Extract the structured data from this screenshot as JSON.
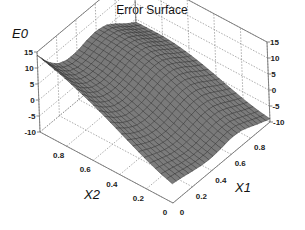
{
  "chart_data": {
    "type": "surface3d",
    "title": "Error Surface",
    "xlabel": "X1",
    "ylabel": "X2",
    "zlabel": "E0",
    "xlim": [
      0,
      1
    ],
    "ylim": [
      0,
      1
    ],
    "zlim": [
      -10,
      15
    ],
    "x_ticks": [
      "0",
      "0.2",
      "0.4",
      "0.6",
      "0.8"
    ],
    "y_ticks": [
      "0",
      "0.2",
      "0.4",
      "0.6",
      "0.8"
    ],
    "z_ticks": [
      "-10",
      "-5",
      "0",
      "5",
      "10",
      "15"
    ],
    "grid": true,
    "surface_color": "#7a7a7a",
    "grid_resolution": 11,
    "x": [
      0,
      0.1,
      0.2,
      0.3,
      0.4,
      0.5,
      0.6,
      0.7,
      0.8,
      0.9,
      1.0
    ],
    "y": [
      0,
      0.1,
      0.2,
      0.3,
      0.4,
      0.5,
      0.6,
      0.7,
      0.8,
      0.9,
      1.0
    ],
    "z_rows_by_x2": [
      [
        -4.0,
        -4.5,
        -5.2,
        -5.8,
        -6.0,
        -5.6,
        -5.0,
        -5.2,
        -6.4,
        -7.8,
        -9.0
      ],
      [
        -2.5,
        -3.4,
        -4.4,
        -5.0,
        -5.0,
        -4.4,
        -3.8,
        -4.0,
        -5.3,
        -6.9,
        -8.3
      ],
      [
        -0.6,
        -2.0,
        -3.3,
        -3.9,
        -3.7,
        -2.9,
        -2.2,
        -2.4,
        -3.8,
        -5.6,
        -7.2
      ],
      [
        1.6,
        -0.4,
        -1.9,
        -2.5,
        -2.2,
        -1.2,
        -0.4,
        -0.6,
        -2.1,
        -4.1,
        -5.9
      ],
      [
        3.8,
        1.3,
        -0.4,
        -1.0,
        -0.6,
        0.5,
        1.4,
        1.2,
        -0.4,
        -2.6,
        -4.5
      ],
      [
        6.0,
        3.0,
        1.1,
        0.5,
        0.9,
        2.1,
        3.0,
        2.8,
        1.1,
        -1.2,
        -3.2
      ],
      [
        8.0,
        4.6,
        2.5,
        1.8,
        2.3,
        3.5,
        4.4,
        4.1,
        2.3,
        -0.1,
        -2.1
      ],
      [
        9.8,
        6.1,
        3.8,
        3.0,
        3.4,
        4.6,
        5.4,
        5.0,
        3.2,
        0.7,
        -1.3
      ],
      [
        11.5,
        7.4,
        4.8,
        3.9,
        4.2,
        5.3,
        6.0,
        5.5,
        3.6,
        1.1,
        -0.9
      ],
      [
        12.8,
        8.4,
        5.6,
        4.5,
        4.7,
        5.7,
        6.3,
        5.7,
        3.7,
        1.1,
        -0.9
      ],
      [
        14.0,
        9.3,
        6.2,
        4.9,
        5.0,
        5.9,
        6.4,
        5.7,
        3.6,
        1.0,
        -1.0
      ]
    ]
  },
  "labels": {
    "title": "Error Surface",
    "zlabel": "E0",
    "x1label": "X1",
    "x2label": "X2"
  }
}
